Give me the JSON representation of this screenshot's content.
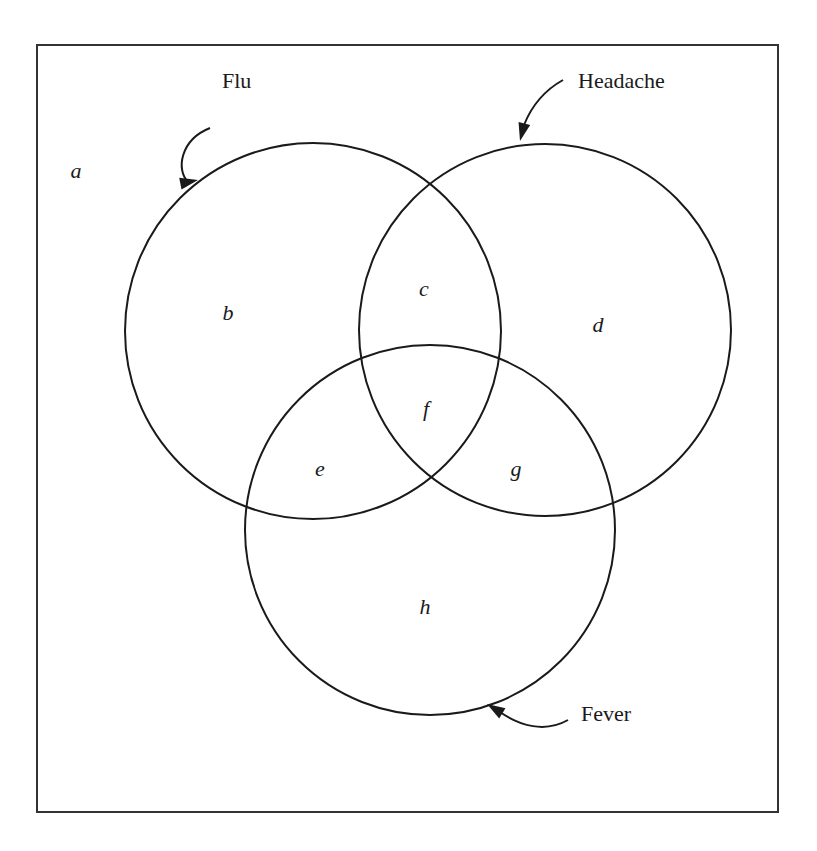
{
  "diagram": {
    "type": "venn",
    "frame": {
      "x": 37,
      "y": 45,
      "width": 741,
      "height": 767,
      "stroke": "#333333"
    },
    "sets": [
      {
        "id": "flu",
        "label": "Flu",
        "cx": 313,
        "cy": 331,
        "r": 188,
        "label_pos": {
          "x": 222,
          "y": 88
        },
        "arrow": {
          "path": "M 210 128 C 180 140, 176 170, 188 182",
          "tip": {
            "x": 198,
            "y": 180
          }
        }
      },
      {
        "id": "headache",
        "label": "Headache",
        "cx": 545,
        "cy": 330,
        "r": 186,
        "label_pos": {
          "x": 578,
          "y": 88
        },
        "arrow": {
          "path": "M 563 80 C 545 90, 532 105, 524 125",
          "tip": {
            "x": 520,
            "y": 141
          }
        }
      },
      {
        "id": "fever",
        "label": "Fever",
        "cx": 430,
        "cy": 530,
        "r": 185,
        "label_pos": {
          "x": 581,
          "y": 721
        },
        "arrow": {
          "path": "M 568 720 C 545 733, 520 726, 500 712",
          "tip": {
            "x": 487,
            "y": 704
          }
        }
      }
    ],
    "regions": [
      {
        "label": "a",
        "x": 76,
        "y": 178,
        "description": "outside all sets"
      },
      {
        "label": "b",
        "x": 228,
        "y": 320,
        "description": "Flu only"
      },
      {
        "label": "c",
        "x": 424,
        "y": 296,
        "description": "Flu and Headache only"
      },
      {
        "label": "d",
        "x": 598,
        "y": 332,
        "description": "Headache only"
      },
      {
        "label": "e",
        "x": 320,
        "y": 476,
        "description": "Flu and Fever only"
      },
      {
        "label": "f",
        "x": 426,
        "y": 416,
        "description": "Flu, Headache and Fever"
      },
      {
        "label": "g",
        "x": 516,
        "y": 476,
        "description": "Headache and Fever only"
      },
      {
        "label": "h",
        "x": 425,
        "y": 614,
        "description": "Fever only"
      }
    ]
  }
}
